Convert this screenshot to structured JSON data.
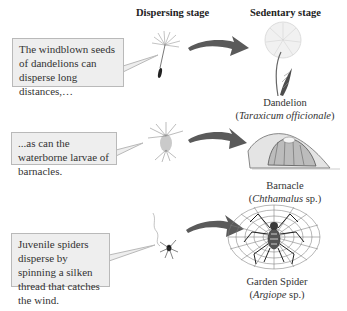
{
  "headers": {
    "dispersing": "Dispersing stage",
    "sedentary": "Sedentary stage"
  },
  "rows": [
    {
      "callout": "The windblown seeds of dandelions can disperse long distances,…",
      "dispersing_icon": "dandelion-seed-icon",
      "sedentary_icon": "dandelion-plant-icon",
      "common_name": "Dandelion",
      "sci_name": "Taraxicum officionale",
      "sci_suffix": ""
    },
    {
      "callout": "...as can the waterborne larvae of barnacles.",
      "dispersing_icon": "barnacle-larva-icon",
      "sedentary_icon": "barnacle-icon",
      "common_name": "Barnacle",
      "sci_name": "Chthamalus",
      "sci_suffix": " sp."
    },
    {
      "callout": "Juvenile spiders disperse by spinning a silken thread that catches the wind.",
      "dispersing_icon": "juvenile-spider-icon",
      "sedentary_icon": "garden-spider-web-icon",
      "common_name": "Garden Spider",
      "sci_name": "Argiope",
      "sci_suffix": " sp."
    }
  ],
  "colors": {
    "arrow": "#5a5a5a",
    "box_fill": "#eeeeee",
    "box_border": "#b9b9b9"
  }
}
